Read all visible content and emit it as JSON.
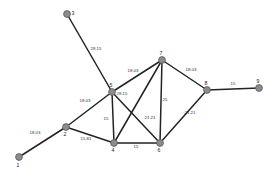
{
  "diagram": {
    "node_fill_color": "#8c8c8c",
    "edge_color": "#232323",
    "background_color": "#ffffff"
  },
  "chart_data": {
    "type": "graph",
    "title": "",
    "nodes": [
      {
        "id": "1",
        "label": "1",
        "x": 19,
        "y": 157,
        "label_dx": -1,
        "label_dy": 10
      },
      {
        "id": "2",
        "label": "2",
        "x": 66,
        "y": 127,
        "label_dx": -1,
        "label_dy": 9
      },
      {
        "id": "3",
        "label": "3",
        "x": 67,
        "y": 14,
        "label_dx": 6,
        "label_dy": 1
      },
      {
        "id": "4",
        "label": "4",
        "x": 114,
        "y": 143,
        "label_dx": -1,
        "label_dy": 9
      },
      {
        "id": "5",
        "label": "5",
        "x": 112,
        "y": 92,
        "label_dx": -1,
        "label_dy": -5
      },
      {
        "id": "6",
        "label": "6",
        "x": 160,
        "y": 143,
        "label_dx": -1,
        "label_dy": 9
      },
      {
        "id": "7",
        "label": "7",
        "x": 162,
        "y": 60,
        "label_dx": -1,
        "label_dy": -5
      },
      {
        "id": "8",
        "label": "8",
        "x": 207,
        "y": 90,
        "label_dx": -1,
        "label_dy": -5
      },
      {
        "id": "9",
        "label": "9",
        "x": 259,
        "y": 88,
        "label_dx": -1,
        "label_dy": -5
      }
    ],
    "edges": [
      {
        "source": "1",
        "target": "2",
        "weight": "18.03",
        "lx": 35,
        "ly": 134
      },
      {
        "source": "2",
        "target": "5",
        "weight": "18.03",
        "lx": 85,
        "ly": 102
      },
      {
        "source": "2",
        "target": "4",
        "weight": "15.81",
        "lx": 86,
        "ly": 140
      },
      {
        "source": "3",
        "target": "5",
        "weight": "28.15",
        "lx": 96,
        "ly": 50
      },
      {
        "source": "5",
        "target": "4",
        "weight": "15",
        "lx": 106,
        "ly": 120
      },
      {
        "source": "5",
        "target": "7",
        "weight": "18.03",
        "lx": 133,
        "ly": 72
      },
      {
        "source": "5",
        "target": "6",
        "weight": "28.15",
        "lx": 122,
        "ly": 95
      },
      {
        "source": "4",
        "target": "6",
        "weight": "15",
        "lx": 136,
        "ly": 148
      },
      {
        "source": "4",
        "target": "7",
        "weight": "21.21",
        "lx": 150,
        "ly": 119
      },
      {
        "source": "6",
        "target": "7",
        "weight": "25",
        "lx": 165,
        "ly": 101
      },
      {
        "source": "7",
        "target": "8",
        "weight": "18.03",
        "lx": 191,
        "ly": 71
      },
      {
        "source": "6",
        "target": "8",
        "weight": "21.21",
        "lx": 190,
        "ly": 114
      },
      {
        "source": "8",
        "target": "9",
        "weight": "15",
        "lx": 233,
        "ly": 85
      }
    ],
    "node_radius": 3.4,
    "xlabel": "",
    "ylabel": "",
    "legend": []
  }
}
